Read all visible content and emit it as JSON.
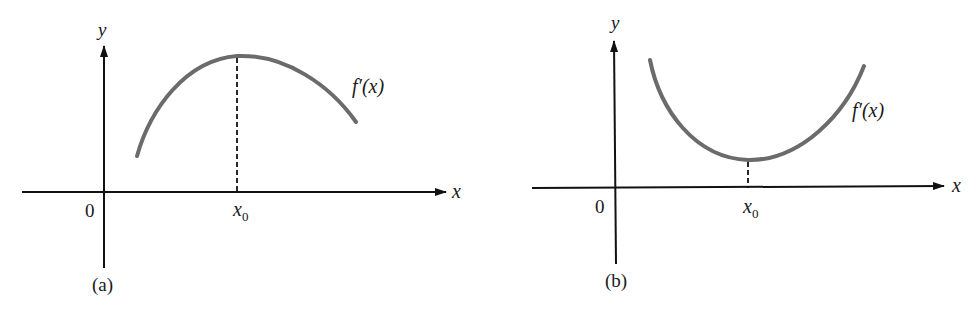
{
  "figure": {
    "background": "#ffffff",
    "curve_color": "#6b6b6b",
    "axis_color": "#111111",
    "panels": [
      {
        "id": "a",
        "caption": "(a)",
        "origin_label": "0",
        "x_axis_label": "x",
        "y_axis_label": "y",
        "marker_label": "x",
        "marker_subscript": "0",
        "curve_label": "f′(x)",
        "curve_shape": "concave-down, maximum at x0"
      },
      {
        "id": "b",
        "caption": "(b)",
        "origin_label": "0",
        "x_axis_label": "x",
        "y_axis_label": "y",
        "marker_label": "x",
        "marker_subscript": "0",
        "curve_label": "f′(x)",
        "curve_shape": "concave-up, minimum at x0"
      }
    ]
  }
}
